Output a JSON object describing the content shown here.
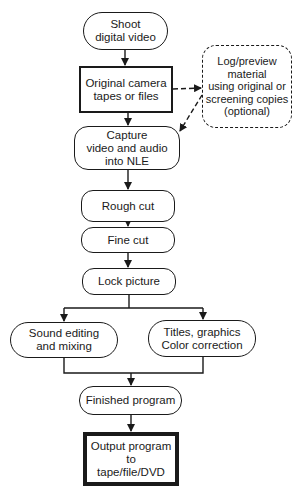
{
  "diagram": {
    "type": "flowchart",
    "nodes": {
      "shoot": "Shoot\ndigital video",
      "original": "Original camera\ntapes or files",
      "log": "Log/preview\nmaterial\nusing original or\nscreening copies\n(optional)",
      "capture": "Capture\nvideo and audio\ninto NLE",
      "rough": "Rough cut",
      "fine": "Fine cut",
      "lock": "Lock picture",
      "sound": "Sound editing\nand mixing",
      "titles": "Titles, graphics\nColor correction",
      "finished": "Finished program",
      "output": "Output program to\ntape/file/DVD"
    },
    "edges": [
      {
        "from": "shoot",
        "to": "original",
        "style": "solid"
      },
      {
        "from": "original",
        "to": "log",
        "style": "dashed"
      },
      {
        "from": "log",
        "to": "capture",
        "style": "dashed"
      },
      {
        "from": "original",
        "to": "capture",
        "style": "solid"
      },
      {
        "from": "capture",
        "to": "rough",
        "style": "solid"
      },
      {
        "from": "rough",
        "to": "fine",
        "style": "solid"
      },
      {
        "from": "fine",
        "to": "lock",
        "style": "solid"
      },
      {
        "from": "lock",
        "to": "sound",
        "style": "solid"
      },
      {
        "from": "lock",
        "to": "titles",
        "style": "solid"
      },
      {
        "from": "sound",
        "to": "finished",
        "style": "solid"
      },
      {
        "from": "titles",
        "to": "finished",
        "style": "solid"
      },
      {
        "from": "finished",
        "to": "output",
        "style": "solid"
      }
    ]
  }
}
